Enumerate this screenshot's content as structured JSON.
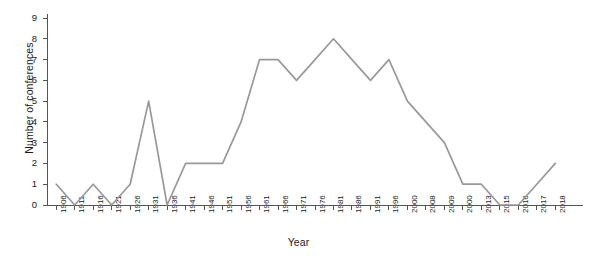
{
  "chart_data": {
    "type": "line",
    "title": "",
    "xlabel": "Year",
    "ylabel": "Number of conferences",
    "ylim": [
      0,
      9
    ],
    "yticks": [
      0,
      1,
      2,
      3,
      4,
      5,
      6,
      7,
      8,
      9
    ],
    "grid": false,
    "legend": false,
    "line_color": "#999999",
    "axis_color": "#555555",
    "categories": [
      "1906",
      "1911",
      "1916",
      "1921",
      "1926",
      "1931",
      "1936",
      "1941",
      "1946",
      "1951",
      "1956",
      "1961",
      "1966",
      "1971",
      "1976",
      "1981",
      "1986",
      "1991",
      "1996",
      "2000",
      "2008",
      "2009",
      "2000",
      "2013",
      "2015",
      "2016",
      "2017",
      "2018"
    ],
    "values": [
      1,
      0,
      1,
      0,
      1,
      5,
      0,
      2,
      2,
      2,
      4,
      7,
      7,
      6,
      7,
      8,
      7,
      6,
      7,
      5,
      4,
      3,
      1,
      1,
      0,
      0,
      1,
      2
    ],
    "series": [
      {
        "name": "Number of conferences",
        "values": [
          1,
          0,
          1,
          0,
          1,
          5,
          0,
          2,
          2,
          2,
          4,
          7,
          7,
          6,
          7,
          8,
          7,
          6,
          7,
          5,
          4,
          3,
          1,
          1,
          0,
          0,
          1,
          2
        ]
      }
    ]
  }
}
